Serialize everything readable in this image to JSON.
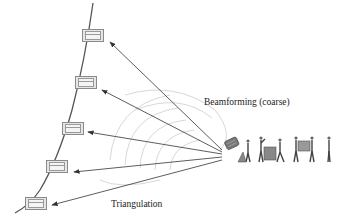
{
  "labels": {
    "beamforming": "Beamforming (coarse)",
    "triangulation": "Triangulation"
  },
  "colors": {
    "curve": "#555555",
    "arrow": "#333333",
    "wave": "#d8d8d8",
    "node_fill": "#e6e6e6",
    "node_border": "#8a8a8a"
  },
  "source": {
    "x": 222,
    "y": 150,
    "name": "antenna-array"
  },
  "nodes": [
    {
      "id": "node-1",
      "x": 82,
      "y": 33
    },
    {
      "id": "node-2",
      "x": 75,
      "y": 80
    },
    {
      "id": "node-3",
      "x": 62,
      "y": 123
    },
    {
      "id": "node-4",
      "x": 46,
      "y": 163
    },
    {
      "id": "node-5",
      "x": 25,
      "y": 197
    }
  ],
  "people_count": 7
}
